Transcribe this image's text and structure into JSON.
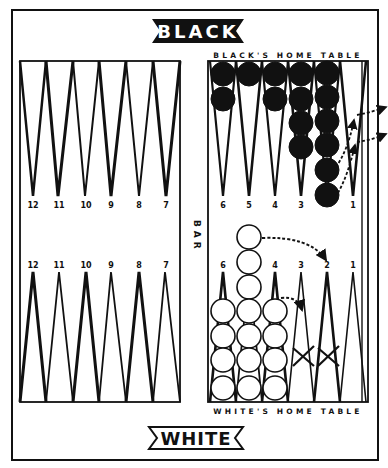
{
  "banners": {
    "top": "BLACK",
    "bottom": "WHITE"
  },
  "tables": {
    "black_home": "BLACK'S HOME TABLE",
    "white_home": "WHITE'S HOME TABLE"
  },
  "bar_label": "BAR",
  "outer_board": {
    "top_points": [
      "12",
      "11",
      "10",
      "9",
      "8",
      "7"
    ],
    "bottom_points": [
      "12",
      "11",
      "10",
      "9",
      "8",
      "7"
    ]
  },
  "home_board": {
    "top_points": [
      "6",
      "5",
      "4",
      "3",
      "2",
      "1"
    ],
    "bottom_points": [
      "6",
      "5",
      "4",
      "3",
      "2",
      "1"
    ]
  },
  "checkers": {
    "black": [
      {
        "point": "6",
        "count": 2
      },
      {
        "point": "5",
        "count": 1
      },
      {
        "point": "4",
        "count": 2
      },
      {
        "point": "3",
        "count": 4
      },
      {
        "point": "2",
        "count": 6
      }
    ],
    "white": [
      {
        "point": "6",
        "count": 4
      },
      {
        "point": "5",
        "count": 7
      },
      {
        "point": "4",
        "count": 4
      }
    ]
  },
  "marks": {
    "blocked_points": [
      "3",
      "2"
    ],
    "white_moves": [
      {
        "from": "5",
        "to": "2"
      },
      {
        "from": "4",
        "to": "3"
      }
    ],
    "black_moves": [
      {
        "from": "2",
        "to": "1"
      },
      {
        "from": "2",
        "to": "1"
      },
      {
        "from": "1",
        "to": "off"
      },
      {
        "from": "1",
        "to": "off"
      }
    ]
  },
  "colors": {
    "ink": "#111111",
    "paper": "#ffffff"
  }
}
